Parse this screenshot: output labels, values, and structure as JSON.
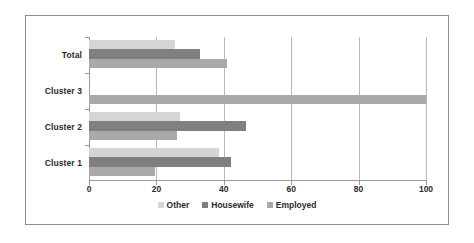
{
  "chart_data": {
    "type": "bar",
    "orientation": "horizontal",
    "title": "",
    "subtitle": "",
    "xlabel": "",
    "ylabel": "",
    "categories": [
      "Cluster 1",
      "Cluster 2",
      "Cluster 3",
      "Total"
    ],
    "categories_top_to_bottom": [
      "Total",
      "Cluster 3",
      "Cluster 2",
      "Cluster 1"
    ],
    "series": [
      {
        "name": "Other",
        "color": "#d5d5d5",
        "values": [
          38.5,
          27.0,
          0.0,
          25.5
        ]
      },
      {
        "name": "Housewife",
        "color": "#7f7f7f",
        "values": [
          42.0,
          46.5,
          0.0,
          33.0
        ]
      },
      {
        "name": "Employed",
        "color": "#a9a9a9",
        "values": [
          19.5,
          26.0,
          100.0,
          41.0
        ]
      }
    ],
    "xlim": [
      0,
      100
    ],
    "xticks": [
      0,
      20,
      40,
      60,
      80,
      100
    ],
    "xtick_labels": [
      "0",
      "20",
      "40",
      "60",
      "80",
      "100"
    ],
    "grid": "vertical",
    "legend_position": "bottom",
    "legend_entries": [
      "Other",
      "Housewife",
      "Employed"
    ],
    "annotations": []
  },
  "legend": {
    "items": [
      {
        "label": "Other"
      },
      {
        "label": "Housewife"
      },
      {
        "label": "Employed"
      }
    ]
  },
  "axis": {
    "x_labels": [
      "0",
      "20",
      "40",
      "60",
      "80",
      "100"
    ],
    "y_labels": [
      "Total",
      "Cluster 3",
      "Cluster 2",
      "Cluster 1"
    ]
  },
  "colors": {
    "other": "#d5d5d5",
    "housewife": "#7f7f7f",
    "employed": "#a9a9a9",
    "grid": "#b9b9b9",
    "axis": "#9a9a9a",
    "frame": "#8c8c8c",
    "text": "#2b2b2b"
  }
}
